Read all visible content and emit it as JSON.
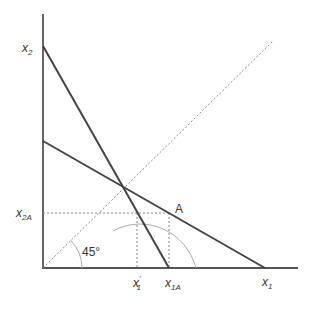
{
  "diagram": {
    "type": "economics-budget-constraint",
    "colors": {
      "axis": "#555555",
      "line": "#444444",
      "dashed": "#888888",
      "arc": "#aaaaaa",
      "text": "#333333"
    },
    "axes": {
      "y_label": {
        "main": "x",
        "sub": "2"
      },
      "x_label": {
        "main": "x",
        "sub": "1"
      }
    },
    "labels": {
      "x2A": {
        "main": "x",
        "sub": "2A"
      },
      "x1_prime": {
        "main": "x",
        "sub": "1",
        "prime": "′"
      },
      "x1A": {
        "main": "x",
        "sub": "1A"
      },
      "point_A": "A",
      "angle": "45°"
    },
    "lines": {
      "steep_line": {
        "from": [
          43,
          46
        ],
        "to": [
          169,
          268
        ]
      },
      "flat_line": {
        "from": [
          43,
          141
        ],
        "to": [
          265,
          268
        ]
      },
      "diagonal_45": {
        "from": [
          43,
          268
        ],
        "to": [
          273,
          41
        ]
      },
      "horizontal_dashed_x2A": {
        "from": [
          43,
          213
        ],
        "to": [
          169,
          213
        ]
      },
      "vertical_dashed_x1_prime": {
        "from": [
          137,
          213
        ],
        "to": [
          137,
          268
        ]
      },
      "vertical_dashed_x1A": {
        "from": [
          169,
          213
        ],
        "to": [
          169,
          268
        ]
      }
    },
    "points": {
      "origin": [
        43,
        268
      ],
      "intersection": [
        123,
        188
      ],
      "A": [
        169,
        213
      ]
    }
  }
}
